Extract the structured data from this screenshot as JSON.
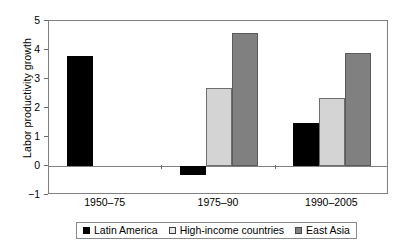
{
  "chart_data": {
    "type": "bar",
    "title": "",
    "subtitle": "",
    "xlabel": "",
    "ylabel": "Labor productivity growth",
    "categories": [
      "1950–75",
      "1975–90",
      "1990–2005"
    ],
    "series": [
      {
        "name": "Latin America",
        "color": "#000000",
        "values": [
          3.8,
          -0.3,
          1.5
        ]
      },
      {
        "name": "High-income countries",
        "color": "#d4d4d4",
        "values": [
          null,
          2.7,
          2.35
        ]
      },
      {
        "name": "East Asia",
        "color": "#808080",
        "values": [
          null,
          4.6,
          3.9
        ]
      }
    ],
    "ylim": [
      -1,
      5
    ],
    "yticks": [
      5,
      4,
      3,
      2,
      1,
      0,
      -1
    ],
    "ytick_labels": [
      "5",
      "4",
      "3",
      "2",
      "1",
      "0",
      "−1"
    ],
    "grid": false,
    "zero_line": true,
    "legend_position": "bottom"
  },
  "legend": {
    "entries": [
      {
        "label": "Latin America"
      },
      {
        "label": "High-income countries"
      },
      {
        "label": "East Asia"
      }
    ]
  },
  "colors": {
    "latin_america": "#000000",
    "high_income": "#d4d4d4",
    "east_asia": "#808080",
    "axis": "#808080",
    "text": "#000000"
  }
}
